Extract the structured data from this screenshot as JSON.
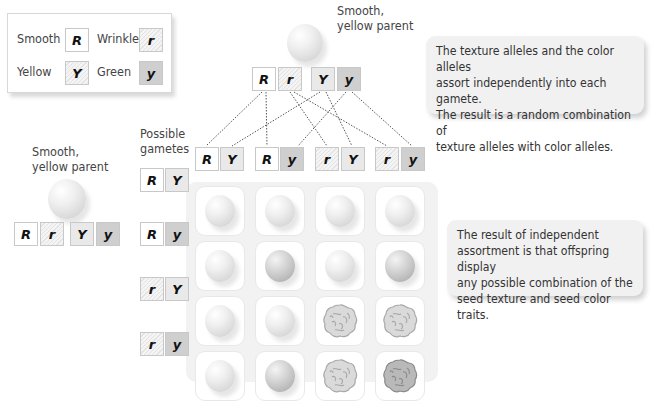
{
  "legend": {
    "items": [
      {
        "label": "Smooth",
        "allele": "R",
        "style": "R"
      },
      {
        "label": "Wrinkled",
        "allele": "r",
        "style": "r"
      },
      {
        "label": "Yellow",
        "allele": "Y",
        "style": "Y"
      },
      {
        "label": "Green",
        "allele": "y",
        "style": "y"
      }
    ]
  },
  "top_parent": {
    "label_line1": "Smooth,",
    "label_line2": "yellow parent",
    "alleles": [
      "R",
      "r",
      "Y",
      "y"
    ]
  },
  "left_parent": {
    "label_line1": "Smooth,",
    "label_line2": "yellow parent",
    "alleles": [
      "R",
      "r",
      "Y",
      "y"
    ]
  },
  "gametes_label_line1": "Possible",
  "gametes_label_line2": "gametes",
  "column_gametes": [
    {
      "texture": "R",
      "color": "Y"
    },
    {
      "texture": "R",
      "color": "y"
    },
    {
      "texture": "r",
      "color": "Y"
    },
    {
      "texture": "r",
      "color": "y"
    }
  ],
  "row_gametes": [
    {
      "texture": "R",
      "color": "Y"
    },
    {
      "texture": "R",
      "color": "y"
    },
    {
      "texture": "r",
      "color": "Y"
    },
    {
      "texture": "r",
      "color": "y"
    }
  ],
  "punnett_grid": [
    [
      "smooth-yellow",
      "smooth-yellow",
      "smooth-yellow",
      "smooth-yellow"
    ],
    [
      "smooth-yellow",
      "smooth-green",
      "smooth-yellow",
      "smooth-green"
    ],
    [
      "smooth-yellow",
      "smooth-yellow",
      "wrinkled-yellow",
      "wrinkled-yellow"
    ],
    [
      "smooth-yellow",
      "smooth-green",
      "wrinkled-yellow",
      "wrinkled-green"
    ]
  ],
  "info_boxes": [
    {
      "lines": [
        "The texture alleles and the color alleles",
        "assort independently into each gamete.",
        "The result is a random combination of",
        "texture alleles with color alleles."
      ]
    },
    {
      "lines": [
        "The result of independent",
        "assortment is that offspring display",
        "any possible combination of the",
        "seed texture and seed color traits."
      ]
    }
  ],
  "colors": {
    "smooth_allele": "#ffffff",
    "wrinkled_allele": "#ebebeb",
    "yellow_allele": "#e9e9e9",
    "green_allele": "#cfcfcf",
    "grid_panel": "#f2f2f2",
    "info_box": "#f1f1f1"
  }
}
